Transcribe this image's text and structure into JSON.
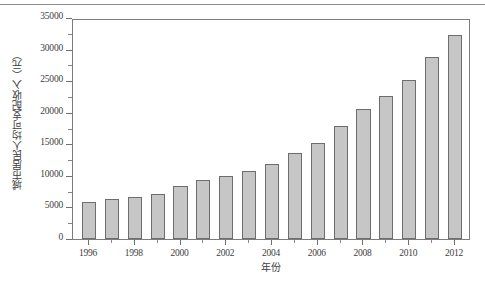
{
  "figure": {
    "background_color": "#ffffff",
    "top_rule_color": "#8d8d8d",
    "frame_color": "#7d7d7d"
  },
  "axis_titles": {
    "y": "城市居民人均可支配收入（元）",
    "x": "年份"
  },
  "chart_data": {
    "type": "bar",
    "title": "",
    "subtitle": "",
    "xlabel": "年份",
    "ylabel": "城市居民人均可支配收入（元）",
    "categories": [
      "1996",
      "1997",
      "1998",
      "1999",
      "2000",
      "2001",
      "2002",
      "2003",
      "2004",
      "2005",
      "2006",
      "2007",
      "2008",
      "2009",
      "2010",
      "2011",
      "2012"
    ],
    "values": [
      5850,
      6350,
      6700,
      7050,
      8400,
      9350,
      10000,
      10800,
      11900,
      13600,
      15250,
      17950,
      20600,
      22650,
      25200,
      28800,
      32350
    ],
    "ylim": [
      0,
      35000
    ],
    "xlim": [
      "1995.3",
      "2012.7"
    ],
    "y_ticks": [
      0,
      5000,
      10000,
      15000,
      20000,
      25000,
      30000,
      35000
    ],
    "y_tick_labels": [
      "0",
      "5000",
      "10000",
      "15000",
      "20000",
      "25000",
      "30000",
      "35000"
    ],
    "y_minor_ticks": [
      2500,
      7500,
      12500,
      17500,
      22500,
      27500,
      32500
    ],
    "x_ticks": [
      1996,
      1998,
      2000,
      2002,
      2004,
      2006,
      2008,
      2010,
      2012
    ],
    "x_tick_labels": [
      "1996",
      "1998",
      "2000",
      "2002",
      "2004",
      "2006",
      "2008",
      "2010",
      "2012"
    ],
    "x_minor_ticks": [
      1997,
      1999,
      2001,
      2003,
      2005,
      2007,
      2009,
      2011
    ],
    "grid": false,
    "legend": null,
    "legend_position": "none",
    "bar_fill_color": "#c6c6c6",
    "bar_edge_color": "#6d6d6d"
  }
}
